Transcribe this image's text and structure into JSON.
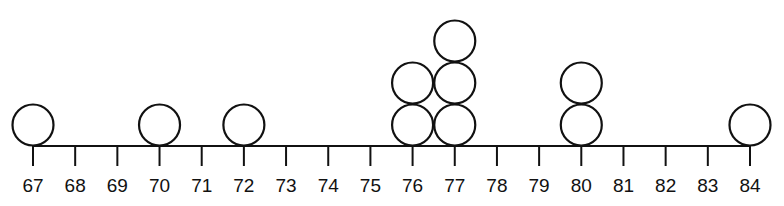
{
  "chart_data": {
    "type": "dot-plot",
    "title": "",
    "xlabel": "",
    "ylabel": "",
    "x_range": [
      67,
      84
    ],
    "tick_labels": [
      "67",
      "68",
      "69",
      "70",
      "71",
      "72",
      "73",
      "74",
      "75",
      "76",
      "77",
      "78",
      "79",
      "80",
      "81",
      "82",
      "83",
      "84"
    ],
    "values": [
      67,
      70,
      72,
      76,
      76,
      77,
      77,
      77,
      80,
      80,
      84
    ],
    "counts": {
      "67": 1,
      "70": 1,
      "72": 1,
      "76": 2,
      "77": 3,
      "80": 2,
      "84": 1
    },
    "marker": "open-circle",
    "grid": false,
    "legend": false
  },
  "colors": {
    "stroke": "#111111",
    "background": "#ffffff"
  }
}
